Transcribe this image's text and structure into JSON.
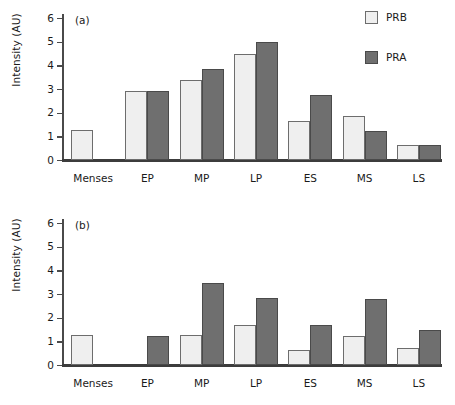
{
  "figure": {
    "background": "#ffffff",
    "prb_color": "#efefef",
    "pra_color": "#6f6f6f"
  },
  "legend": {
    "position": "top-right",
    "entries": [
      {
        "label": "PRB",
        "swatch": "light-square-swatch"
      },
      {
        "label": "PRA",
        "swatch": "dark-square-swatch"
      }
    ]
  },
  "panels": [
    {
      "tag": "(a)",
      "ylabel": "Intensity (AU)",
      "yticks": [
        "0",
        "1",
        "2",
        "3",
        "4",
        "5",
        "6"
      ],
      "categories": [
        "Menses",
        "EP",
        "MP",
        "LP",
        "ES",
        "MS",
        "LS"
      ]
    },
    {
      "tag": "(b)",
      "ylabel": "Intensity (AU)",
      "yticks": [
        "0",
        "1",
        "2",
        "3",
        "4",
        "5",
        "6"
      ],
      "categories": [
        "Menses",
        "EP",
        "MP",
        "LP",
        "ES",
        "MS",
        "LS"
      ]
    }
  ],
  "chart_data": [
    {
      "type": "bar",
      "title": "(a)",
      "xlabel": "",
      "ylabel": "Intensity (AU)",
      "ylim": [
        0,
        6
      ],
      "yticks": [
        0,
        1,
        2,
        3,
        4,
        5,
        6
      ],
      "grid": false,
      "legend_position": "top-right",
      "categories": [
        "Menses",
        "EP",
        "MP",
        "LP",
        "ES",
        "MS",
        "LS"
      ],
      "series": [
        {
          "name": "PRB",
          "color": "#efefef",
          "values": [
            1.25,
            2.93,
            3.38,
            4.47,
            1.65,
            1.88,
            0.62
          ]
        },
        {
          "name": "PRA",
          "color": "#6f6f6f",
          "values": [
            null,
            2.93,
            3.83,
            4.97,
            2.73,
            1.23,
            0.62
          ]
        }
      ]
    },
    {
      "type": "bar",
      "title": "(b)",
      "xlabel": "",
      "ylabel": "Intensity (AU)",
      "ylim": [
        0,
        6
      ],
      "yticks": [
        0,
        1,
        2,
        3,
        4,
        5,
        6
      ],
      "grid": false,
      "legend_position": "none",
      "categories": [
        "Menses",
        "EP",
        "MP",
        "LP",
        "ES",
        "MS",
        "LS"
      ],
      "series": [
        {
          "name": "PRB",
          "color": "#efefef",
          "values": [
            1.25,
            null,
            1.25,
            1.7,
            0.65,
            1.22,
            0.7
          ]
        },
        {
          "name": "PRA",
          "color": "#6f6f6f",
          "values": [
            null,
            1.22,
            3.45,
            2.82,
            1.67,
            2.8,
            1.48
          ]
        }
      ]
    }
  ]
}
